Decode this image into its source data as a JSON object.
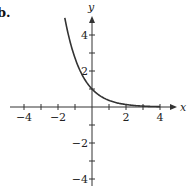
{
  "figure": {
    "part_label": "b."
  },
  "chart_data": {
    "type": "line",
    "title": "",
    "xlabel": "x",
    "ylabel": "y",
    "xlim": [
      -4.8,
      4.8
    ],
    "ylim": [
      -4.5,
      5
    ],
    "x_ticks": [
      -4,
      -3,
      -2,
      -1,
      1,
      2,
      3,
      4
    ],
    "x_tick_labels": [
      {
        "value": -4,
        "label": "−4"
      },
      {
        "value": -2,
        "label": "−2"
      },
      {
        "value": 2,
        "label": "2"
      },
      {
        "value": 4,
        "label": "4"
      }
    ],
    "y_ticks": [
      -4,
      -3,
      -2,
      -1,
      1,
      2,
      3,
      4
    ],
    "y_tick_labels": [
      {
        "value": 4,
        "label": "4"
      },
      {
        "value": 2,
        "label": "2"
      },
      {
        "value": -2,
        "label": "−2"
      },
      {
        "value": -4,
        "label": "−4"
      }
    ],
    "grid": false,
    "series": [
      {
        "name": "exponential decay",
        "description": "decreasing exponential curve passing through (0, 1), approaching the x-axis as x increases",
        "x": [
          -1.6,
          -1.2,
          -0.8,
          -0.4,
          0,
          0.4,
          0.8,
          1.2,
          1.6,
          2.0,
          2.5,
          3.0,
          3.5,
          4.0
        ],
        "y": [
          4.95,
          3.32,
          2.23,
          1.49,
          1.0,
          0.67,
          0.45,
          0.3,
          0.2,
          0.14,
          0.08,
          0.05,
          0.03,
          0.02
        ]
      }
    ],
    "colors": {
      "curve": "#333333",
      "axes": "#333333"
    }
  }
}
